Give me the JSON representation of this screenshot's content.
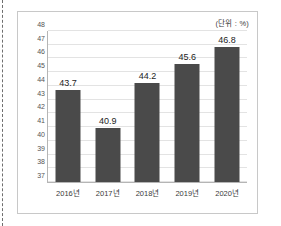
{
  "annotation": {
    "unit": "(단위 : %)"
  },
  "chart_data": {
    "type": "bar",
    "title": "",
    "subtitle": "",
    "xlabel": "",
    "ylabel": "",
    "unit_note": "(단위 : %)",
    "categories": [
      "2016년",
      "2017년",
      "2018년",
      "2019년",
      "2020년"
    ],
    "values": [
      43.7,
      40.9,
      44.2,
      45.6,
      46.8
    ],
    "value_labels": [
      "43.7",
      "40.9",
      "44.2",
      "45.6",
      "46.8"
    ],
    "ylim": [
      37,
      48
    ],
    "ytick_labels": [
      "37",
      "38",
      "39",
      "40",
      "41",
      "42",
      "43",
      "44",
      "45",
      "46",
      "47",
      "48"
    ],
    "yticks": [
      37,
      38,
      39,
      40,
      41,
      42,
      43,
      44,
      45,
      46,
      47,
      48
    ],
    "grid": true,
    "legend": null,
    "bar_color": "#4a4a4a",
    "grid_color": "#e3e3e3",
    "axis_color": "#b5b5b5"
  }
}
